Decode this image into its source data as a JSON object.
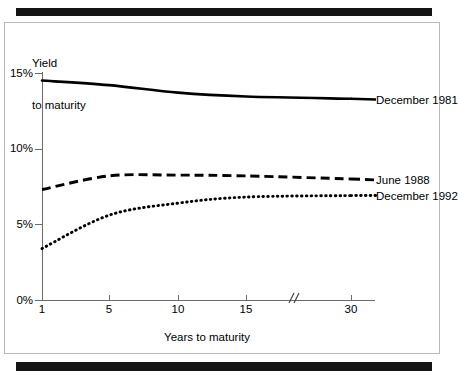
{
  "figure": {
    "y_axis_title_line1": "Yield",
    "y_axis_title_line2": "to maturity",
    "x_axis_title": "Years to maturity",
    "axis_break_marker": "//"
  },
  "chart_data": {
    "type": "line",
    "title": "",
    "subtitle": "",
    "xlabel": "Years to maturity",
    "ylabel": "Yield to maturity",
    "x": [
      1,
      5,
      10,
      15,
      30
    ],
    "xtick_labels": [
      "1",
      "5",
      "10",
      "15",
      "30"
    ],
    "ytick_labels": [
      "0%",
      "5%",
      "10%",
      "15%"
    ],
    "ytick_values": [
      0,
      5,
      10,
      15
    ],
    "ylim": [
      0,
      15
    ],
    "xlim": [
      1,
      30
    ],
    "x_axis_has_break": true,
    "x_axis_break_between": [
      15,
      30
    ],
    "grid": false,
    "legend_position": "right-of-line-ends",
    "units": "percent",
    "series": [
      {
        "name": "December 1981",
        "style": "solid",
        "color": "#000000",
        "values": [
          14.5,
          14.2,
          13.7,
          13.45,
          13.3
        ],
        "label": "December 1981"
      },
      {
        "name": "June 1988",
        "style": "dashed",
        "color": "#000000",
        "values": [
          7.3,
          8.2,
          8.25,
          8.2,
          8.0
        ],
        "label": "June 1988"
      },
      {
        "name": "December 1992",
        "style": "dotted",
        "color": "#000000",
        "values": [
          3.4,
          5.6,
          6.4,
          6.8,
          6.9
        ],
        "label": "December 1992"
      }
    ]
  },
  "colors": {
    "ink": "#000000",
    "axis": "#6b6b6b",
    "frame": "#b9b9b9",
    "rule": "#141414",
    "background": "#ffffff"
  }
}
